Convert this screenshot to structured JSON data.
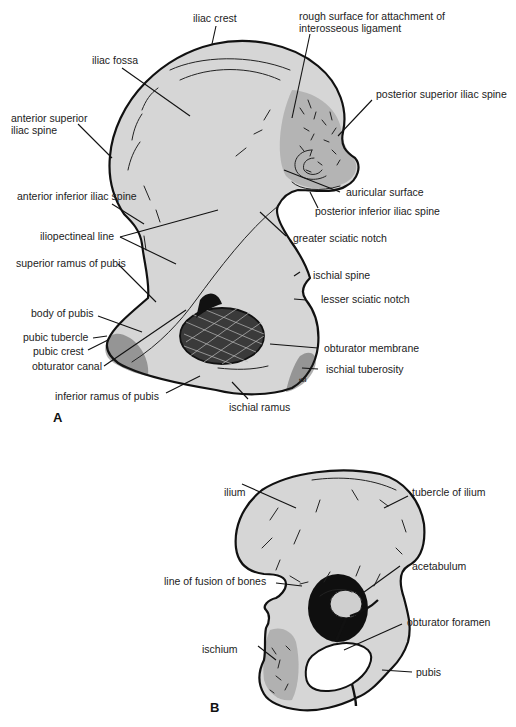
{
  "figure_a": {
    "panel_label": "A",
    "labels": {
      "iliac_crest": "iliac crest",
      "rough_surface_line1": "rough surface for attachment of",
      "rough_surface_line2": "interosseous ligament",
      "iliac_fossa": "iliac fossa",
      "posterior_superior_iliac_spine": "posterior superior iliac spine",
      "anterior_superior_iliac_spine_line1": "anterior superior",
      "anterior_superior_iliac_spine_line2": "iliac spine",
      "auricular_surface": "auricular surface",
      "posterior_inferior_iliac_spine": "posterior inferior iliac spine",
      "anterior_inferior_iliac_spine": "anterior inferior iliac spine",
      "greater_sciatic_notch": "greater sciatic notch",
      "iliopectineal_line": "iliopectineal line",
      "superior_ramus_of_pubis": "superior ramus of pubis",
      "ischial_spine": "ischial spine",
      "lesser_sciatic_notch": "lesser sciatic notch",
      "body_of_pubis": "body of pubis",
      "pubic_tubercle": "pubic tubercle",
      "pubic_crest": "pubic crest",
      "obturator_canal": "obturator canal",
      "obturator_membrane": "obturator membrane",
      "ischial_tuberosity": "ischial tuberosity",
      "inferior_ramus_of_pubis": "inferior ramus of pubis",
      "ischial_ramus": "ischial ramus",
      "artist_mark": "tbl"
    }
  },
  "figure_b": {
    "panel_label": "B",
    "labels": {
      "ilium": "ilium",
      "tubercle_of_ilium": "tubercle of ilium",
      "line_of_fusion_of_bones": "line of fusion of bones",
      "acetabulum": "acetabulum",
      "obturator_foramen": "obturator foramen",
      "ischium": "ischium",
      "pubis": "pubis"
    }
  },
  "colors": {
    "bone_fill": "#d6d6d6",
    "outline": "#111111",
    "label_text": "#222222",
    "background": "#ffffff"
  }
}
